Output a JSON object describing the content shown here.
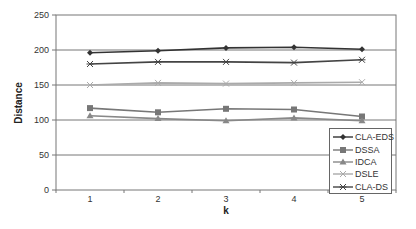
{
  "chart_data": {
    "type": "line",
    "title": "",
    "xlabel": "k",
    "ylabel": "Distance",
    "x": [
      1,
      2,
      3,
      4,
      5
    ],
    "categories": [
      "1",
      "2",
      "3",
      "4",
      "5"
    ],
    "ylim": [
      0,
      250
    ],
    "yticks": [
      0,
      50,
      100,
      150,
      200,
      250
    ],
    "ytick_labels": [
      "0",
      "50",
      "100",
      "150",
      "200",
      "250"
    ],
    "grid": true,
    "legend_position": "lower right (inside plot)",
    "series": [
      {
        "name": "CLA-EDS",
        "marker": "diamond",
        "color": "#333333",
        "values": [
          196,
          199,
          203,
          204,
          201
        ]
      },
      {
        "name": "DSSA",
        "marker": "square",
        "color": "#777777",
        "values": [
          117,
          111,
          116,
          115,
          105
        ]
      },
      {
        "name": "IDCA",
        "marker": "triangle",
        "color": "#888888",
        "values": [
          106,
          102,
          99,
          103,
          99
        ]
      },
      {
        "name": "DSLE",
        "marker": "x",
        "color": "#aaaaaa",
        "values": [
          150,
          153,
          152,
          153,
          154
        ]
      },
      {
        "name": "CLA-DS",
        "marker": "star",
        "color": "#444444",
        "values": [
          180,
          183,
          183,
          182,
          186
        ]
      }
    ]
  }
}
